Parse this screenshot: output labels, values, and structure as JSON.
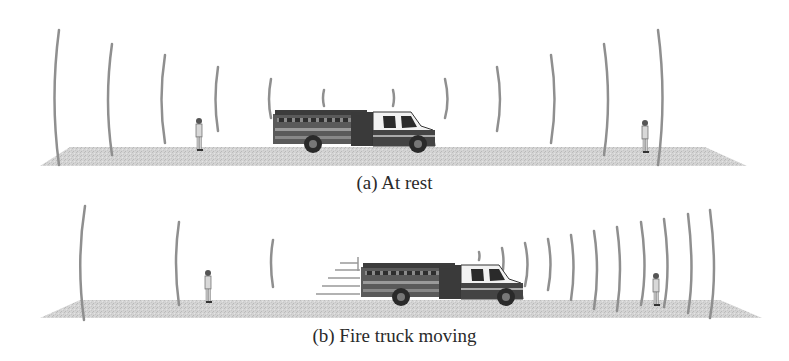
{
  "figure": {
    "panels": [
      {
        "id": "a",
        "caption": "(a) At rest",
        "description": "Stationary fire truck emitting sound wavefronts symmetrically; observers on both sides hear same frequency",
        "truck_state": "at rest",
        "wavefronts_left": 6,
        "wavefronts_right": 6
      },
      {
        "id": "b",
        "caption": "(b) Fire truck moving",
        "description": "Fire truck moving to the right; wavefronts compressed ahead of truck and spread out behind it",
        "truck_state": "moving right",
        "wavefronts_behind": 3,
        "wavefronts_ahead": 11
      }
    ],
    "colors": {
      "wavefront": "#8f8f8f",
      "ground": "#cfcfcf",
      "truck_body": "#4a4a4a",
      "text": "#2a2a2a"
    }
  }
}
